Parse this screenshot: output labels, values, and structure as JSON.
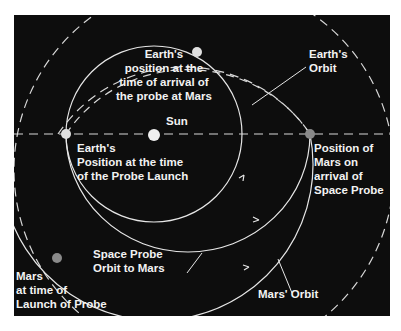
{
  "diagram": {
    "colors": {
      "background": "#0d0d0d",
      "lines": "#e6e6e6",
      "earth": "#e8e8e8",
      "mars": "#8a8a8a",
      "text": "#f2f2f2"
    },
    "labels": {
      "sun": "Sun",
      "earth_arrival": "Earth's\nposition at the\ntime of arrival of\nthe probe at Mars",
      "earth_orbit": "Earth's\nOrbit",
      "earth_launch": "Earth's\nPosition at the time\nof the Probe Launch",
      "mars_arrival": "Position of\nMars on\narrival of\nSpace Probe",
      "probe_orbit": "Space Probe\nOrbit to Mars",
      "mars_launch": "Mars\nat time of\nLaunch of Probe",
      "mars_orbit": "Mars' Orbit"
    }
  }
}
